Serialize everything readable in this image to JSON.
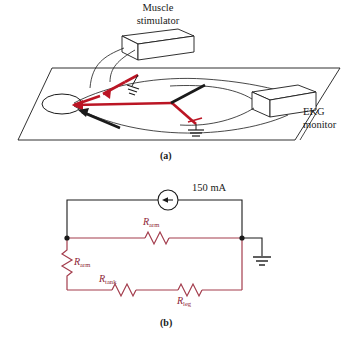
{
  "figure": {
    "caption_a": "(a)",
    "caption_b": "(b)",
    "panel_a": {
      "label_muscle_stimulator": "Muscle\nstimulator",
      "label_muscle_stimulator_line1": "Muscle",
      "label_muscle_stimulator_line2": "stimulator",
      "label_ekg_monitor_line1": "EKG",
      "label_ekg_monitor_line2": "monitor",
      "elements": [
        "patient-table-plane",
        "patient-head-ellipse",
        "muscle-stimulator-box",
        "ekg-monitor-box",
        "stimulator-lead-wires",
        "ekg-lead-wires",
        "red-electrode-arrows",
        "black-electrode-arrows",
        "ground-symbol-upper",
        "ground-symbol-lower"
      ]
    },
    "panel_b": {
      "source_label": "150 mA",
      "resistors": [
        {
          "id": "r-arm-top",
          "name": "R",
          "sub": "arm"
        },
        {
          "id": "r-arm-left",
          "name": "R",
          "sub": "arm"
        },
        {
          "id": "r-tank",
          "name": "R",
          "sub": "tank"
        },
        {
          "id": "r-leg",
          "name": "R",
          "sub": "leg"
        }
      ],
      "nodes": [
        "left-node",
        "right-node"
      ],
      "ground": "earth-ground-symbol"
    },
    "colors": {
      "wire_red_panel_a": "#bb1524",
      "wire_red_panel_b": "#a33c4c",
      "wire_black": "#1a1a1a",
      "outline": "#1a1a1a",
      "label_red": "#8d2636",
      "background": "#ffffff"
    }
  }
}
